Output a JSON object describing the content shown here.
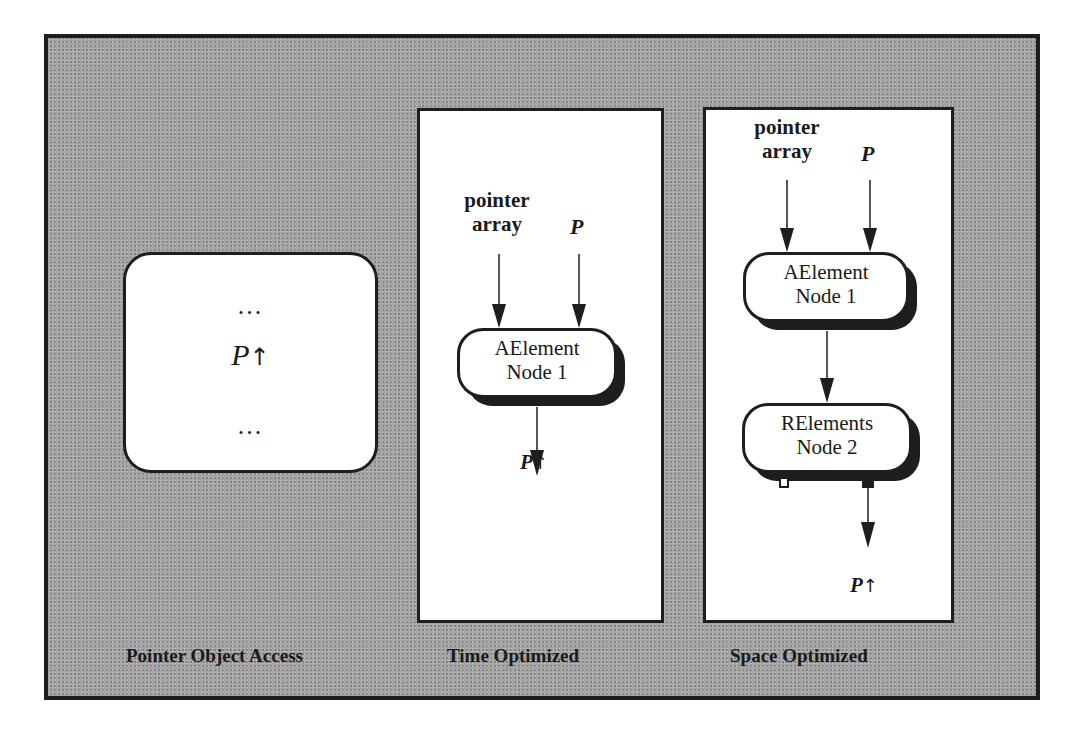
{
  "figure": {
    "panels": [
      {
        "id": "pointer-object-access",
        "caption": "Pointer Object Access",
        "box": {
          "top_dots": "...",
          "expression": "P",
          "arrow_glyph": "↑",
          "bottom_dots": "..."
        }
      },
      {
        "id": "time-optimized",
        "caption": "Time Optimized",
        "inputs": [
          {
            "label": "pointer\narray",
            "line1": "pointer",
            "line2": "array"
          },
          {
            "label": "P"
          }
        ],
        "nodes": [
          {
            "line1": "AElement",
            "line2": "Node 1"
          }
        ],
        "output": {
          "expression": "P",
          "arrow_glyph": "↑"
        }
      },
      {
        "id": "space-optimized",
        "caption": "Space Optimized",
        "inputs": [
          {
            "line1": "pointer",
            "line2": "array"
          },
          {
            "label": "P"
          }
        ],
        "nodes": [
          {
            "line1": "AElement",
            "line2": "Node 1"
          },
          {
            "line1": "RElements",
            "line2": "Node 2"
          }
        ],
        "output": {
          "expression": "P",
          "arrow_glyph": "↑"
        }
      }
    ],
    "colors": {
      "background": "#a4a4a4",
      "panel": "#ffffff",
      "ink": "#1e1e1e"
    }
  }
}
